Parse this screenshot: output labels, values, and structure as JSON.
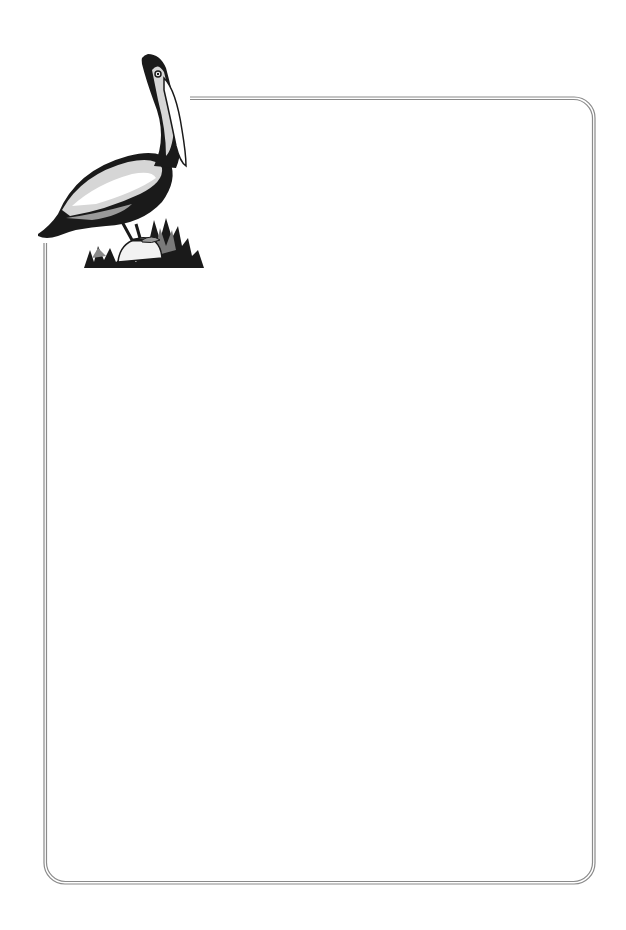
{
  "page": {
    "type": "stationery-border",
    "background": "#ffffff"
  },
  "frame": {
    "style": "double-line rounded border",
    "line_color": "#8a8a8a",
    "corner_radius_px": 22
  },
  "illustration": {
    "subject": "pelican standing on rock with grass",
    "icon": "pelican-icon",
    "colors": [
      "#1a1a1a",
      "#9a9a9a",
      "#d6d6d6",
      "#ffffff"
    ]
  }
}
